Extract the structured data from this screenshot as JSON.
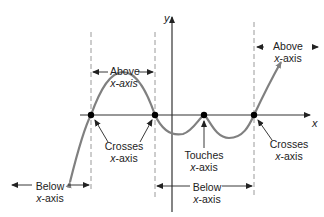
{
  "diagram": {
    "type": "polynomial-graph-behavior",
    "axes": {
      "x_label": "x",
      "y_label": "y"
    },
    "colors": {
      "curve": "#808080",
      "axis": "#333333",
      "dashed": "#9a9a9a",
      "text": "#222222",
      "point": "#000000"
    },
    "labels": {
      "above_left": {
        "line1": "Above",
        "line2": "x-axis"
      },
      "above_right": {
        "line1": "Above",
        "line2": "x-axis"
      },
      "crosses_left": {
        "line1": "Crosses",
        "line2": "x-axis"
      },
      "touches": {
        "line1": "Touches",
        "line2": "x-axis"
      },
      "crosses_right": {
        "line1": "Crosses",
        "line2": "x-axis"
      },
      "below_left": {
        "line1": "Below",
        "line2": "x-axis"
      },
      "below_middle": {
        "line1": "Below",
        "line2": "x-axis"
      }
    },
    "x_intercepts": [
      {
        "behavior": "crosses"
      },
      {
        "behavior": "crosses"
      },
      {
        "behavior": "touches"
      },
      {
        "behavior": "crosses"
      }
    ]
  }
}
